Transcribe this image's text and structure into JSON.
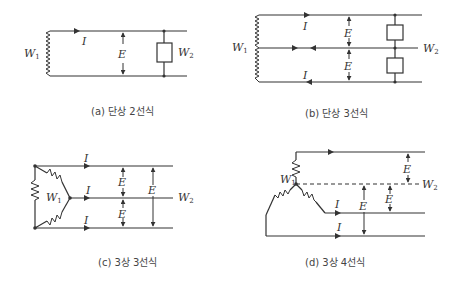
{
  "panels": [
    {
      "id": "a",
      "caption": "(a) 단상 2선식",
      "source": "W₁",
      "load": "W₂",
      "current": "I",
      "voltage": "E"
    },
    {
      "id": "b",
      "caption": "(b) 단상 3선식",
      "source": "W₁",
      "load": "W₂",
      "current": "I",
      "voltage": "E"
    },
    {
      "id": "c",
      "caption": "(c) 3상 3선식",
      "source": "W₁",
      "load": "W₂",
      "current": "I",
      "voltage": "E"
    },
    {
      "id": "d",
      "caption": "(d) 3상 4선식",
      "source": "W₁",
      "load": "W₂",
      "current": "I",
      "voltage": "E"
    }
  ],
  "labels": {
    "I": "I",
    "E": "E",
    "W": "W",
    "sub1": "1",
    "sub2": "2"
  }
}
